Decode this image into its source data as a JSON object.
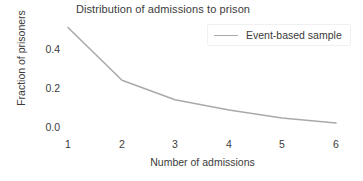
{
  "chart_data": {
    "type": "line",
    "title": "Distribution of admissions to prison",
    "xlabel": "Number of admissions",
    "ylabel": "Fraction of prisoners",
    "x": [
      1,
      2,
      3,
      4,
      5,
      6
    ],
    "xticklabels": [
      "1",
      "2",
      "3",
      "4",
      "5",
      "6"
    ],
    "yticks": [
      0.0,
      0.2,
      0.4
    ],
    "yticklabels": [
      "0.0",
      "0.2",
      "0.4"
    ],
    "xlim": [
      0.7,
      6.3
    ],
    "ylim": [
      0.0,
      0.51
    ],
    "grid": false,
    "legend_position": "top-right",
    "series": [
      {
        "name": "Event-based sample",
        "color": "#a9a9a9",
        "values": [
          0.51,
          0.24,
          0.14,
          0.087,
          0.046,
          0.02
        ]
      }
    ]
  },
  "legend": {
    "entries": [
      {
        "label": "Event-based sample"
      }
    ]
  }
}
